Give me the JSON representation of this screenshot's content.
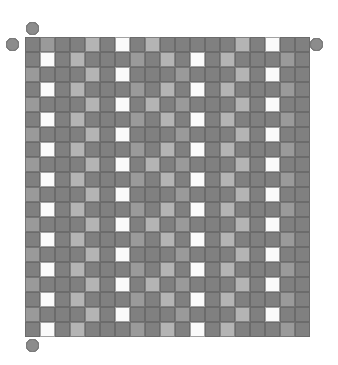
{
  "figure": {
    "name": "gray-scale-mosaic-grid",
    "type": "matrix-mosaic",
    "background_color": "#ffffff"
  },
  "palette": {
    "dark": "#808080",
    "mid": "#9a9a9a",
    "light": "#b4b4b4",
    "white": "#fafafa",
    "grid_line": "#6e6e6e",
    "ring_dark": "#8c8c8c",
    "ring_mid": "#a5a5a5",
    "ring_light": "#c0c0c0",
    "ring_white": "#f2f2f2",
    "ring_stroke": "#7a7a7a"
  },
  "grid": {
    "columns": 19,
    "rows": 20,
    "cell_size_px": 15,
    "origin_x_px": 25,
    "origin_y_px": 37,
    "legend": {
      "0": "dark",
      "1": "mid",
      "2": "light",
      "3": "white"
    },
    "cells": [
      [
        0,
        1,
        0,
        0,
        2,
        0,
        3,
        0,
        2,
        0,
        0,
        0,
        0,
        0,
        2,
        0,
        3,
        0,
        0
      ],
      [
        0,
        3,
        0,
        2,
        0,
        0,
        0,
        1,
        0,
        2,
        0,
        3,
        0,
        2,
        0,
        0,
        0,
        1,
        0
      ],
      [
        1,
        0,
        0,
        0,
        2,
        0,
        3,
        0,
        0,
        0,
        1,
        0,
        0,
        0,
        2,
        0,
        3,
        0,
        0
      ],
      [
        0,
        3,
        0,
        2,
        0,
        0,
        0,
        1,
        0,
        2,
        0,
        3,
        0,
        2,
        0,
        0,
        0,
        1,
        0
      ],
      [
        1,
        0,
        0,
        0,
        2,
        0,
        3,
        0,
        2,
        0,
        1,
        0,
        0,
        0,
        2,
        0,
        3,
        0,
        0
      ],
      [
        0,
        3,
        0,
        2,
        0,
        0,
        0,
        1,
        0,
        2,
        0,
        3,
        0,
        2,
        0,
        0,
        0,
        1,
        0
      ],
      [
        1,
        0,
        0,
        0,
        2,
        0,
        3,
        0,
        0,
        0,
        1,
        0,
        0,
        0,
        2,
        0,
        3,
        0,
        0
      ],
      [
        0,
        3,
        0,
        2,
        0,
        0,
        0,
        1,
        0,
        2,
        0,
        3,
        0,
        2,
        0,
        0,
        0,
        1,
        0
      ],
      [
        1,
        0,
        0,
        0,
        2,
        0,
        3,
        0,
        2,
        0,
        1,
        0,
        0,
        0,
        2,
        0,
        3,
        0,
        0
      ],
      [
        0,
        3,
        0,
        2,
        0,
        0,
        0,
        1,
        0,
        2,
        0,
        3,
        0,
        2,
        0,
        0,
        0,
        1,
        0
      ],
      [
        1,
        0,
        0,
        0,
        2,
        0,
        3,
        0,
        0,
        0,
        1,
        0,
        0,
        0,
        2,
        0,
        3,
        0,
        0
      ],
      [
        0,
        3,
        0,
        2,
        0,
        0,
        0,
        1,
        0,
        2,
        0,
        3,
        0,
        2,
        0,
        0,
        0,
        1,
        0
      ],
      [
        1,
        0,
        0,
        0,
        2,
        0,
        3,
        0,
        2,
        0,
        1,
        0,
        0,
        0,
        2,
        0,
        3,
        0,
        0
      ],
      [
        0,
        3,
        0,
        2,
        0,
        0,
        0,
        1,
        0,
        2,
        0,
        3,
        0,
        2,
        0,
        0,
        0,
        1,
        0
      ],
      [
        1,
        0,
        0,
        0,
        2,
        0,
        3,
        0,
        0,
        0,
        1,
        0,
        0,
        0,
        2,
        0,
        3,
        0,
        0
      ],
      [
        0,
        3,
        0,
        2,
        0,
        0,
        0,
        1,
        0,
        2,
        0,
        3,
        0,
        2,
        0,
        0,
        0,
        1,
        0
      ],
      [
        1,
        0,
        0,
        0,
        2,
        0,
        3,
        0,
        2,
        0,
        1,
        0,
        0,
        0,
        2,
        0,
        3,
        0,
        0
      ],
      [
        0,
        3,
        0,
        2,
        0,
        0,
        0,
        1,
        0,
        2,
        0,
        3,
        0,
        2,
        0,
        0,
        0,
        1,
        0
      ],
      [
        1,
        0,
        0,
        0,
        2,
        0,
        3,
        0,
        0,
        0,
        1,
        0,
        0,
        0,
        2,
        0,
        3,
        0,
        0
      ],
      [
        0,
        3,
        0,
        2,
        0,
        0,
        0,
        1,
        0,
        2,
        0,
        3,
        0,
        2,
        0,
        0,
        0,
        1,
        0
      ]
    ]
  },
  "markers": {
    "legend": {
      "0": "ring_dark",
      "1": "ring_mid",
      "2": "ring_light",
      "3": "ring_white"
    },
    "diameter_px": 13,
    "top": [
      0,
      3,
      0,
      1,
      1,
      0,
      3,
      0,
      1,
      1,
      0,
      3,
      0,
      1,
      1,
      0,
      3,
      0,
      0
    ],
    "bottom": [
      1,
      3,
      0,
      1,
      1,
      0,
      3,
      0,
      1,
      1,
      0,
      3,
      0,
      1,
      1,
      0,
      3,
      0,
      0
    ],
    "left": [
      0,
      1,
      0,
      1,
      0,
      0,
      1,
      0,
      1,
      0,
      0,
      1,
      0,
      1,
      0,
      0,
      1,
      0,
      1,
      0
    ],
    "right": [
      0,
      0,
      1,
      0,
      0,
      1,
      0,
      0,
      1,
      0,
      0,
      1,
      0,
      0,
      1,
      0,
      0,
      1,
      0,
      0
    ]
  }
}
